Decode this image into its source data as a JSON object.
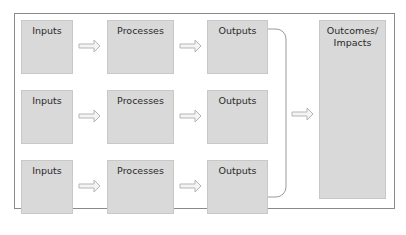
{
  "diagram": {
    "rows": [
      {
        "inputs": "Inputs",
        "processes": "Processes",
        "outputs": "Outputs"
      },
      {
        "inputs": "Inputs",
        "processes": "Processes",
        "outputs": "Outputs"
      },
      {
        "inputs": "Inputs",
        "processes": "Processes",
        "outputs": "Outputs"
      }
    ],
    "outcomes": {
      "line1": "Outcomes/",
      "line2": "Impacts"
    },
    "colors": {
      "box_fill": "#d9d9d9",
      "frame_border": "#8a8a8a",
      "arrow_stroke": "#b5b5b5"
    }
  }
}
